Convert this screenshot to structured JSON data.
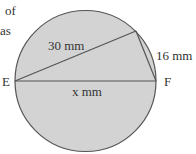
{
  "text_fragments": {
    "line1": "of",
    "line2": "as"
  },
  "diagram": {
    "points": {
      "E": "E",
      "F": "F"
    },
    "labels": {
      "chord_long": "30 mm",
      "chord_short": "16 mm",
      "diameter": "x mm"
    },
    "colors": {
      "circle_fill": "#d3d3d3",
      "stroke": "#555555"
    }
  }
}
